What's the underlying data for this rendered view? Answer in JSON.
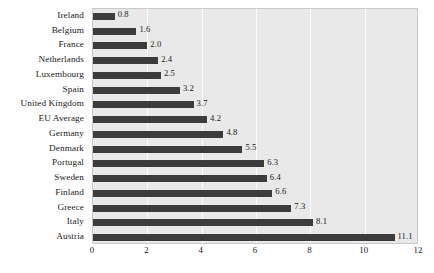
{
  "chart_data": {
    "type": "bar",
    "orientation": "horizontal",
    "title": "",
    "subtitle": "",
    "xlabel": "",
    "ylabel": "",
    "xlim": [
      0,
      12
    ],
    "xticks": [
      "0",
      "2",
      "4",
      "6",
      "8",
      "10",
      "12"
    ],
    "xtick_values": [
      0,
      2,
      4,
      6,
      8,
      10,
      12
    ],
    "grid": "vertical",
    "legend": "none",
    "categories": [
      "Ireland",
      "Belgium",
      "France",
      "Netherlands",
      "Luxembourg",
      "Spain",
      "United Kingdom",
      "EU Average",
      "Germany",
      "Denmark",
      "Portugal",
      "Sweden",
      "Finland",
      "Greece",
      "Italy",
      "Austria"
    ],
    "values": [
      0.8,
      1.6,
      2.0,
      2.4,
      2.5,
      3.2,
      3.7,
      4.2,
      4.8,
      5.5,
      6.3,
      6.4,
      6.6,
      7.3,
      8.1,
      11.1
    ],
    "value_labels": [
      "0.8",
      "1.6",
      "2.0",
      "2.4",
      "2.5",
      "3.2",
      "3.7",
      "4.2",
      "4.8",
      "5.5",
      "6.3",
      "6.4",
      "6.6",
      "7.3",
      "8.1",
      "11.1"
    ],
    "colors": {
      "bar": "#3c3c3c",
      "plot_background": "#e9e9e9",
      "gridline": "#fbfbfb",
      "axis_text": "#1a1a1a",
      "plot_border": "#c9c9c9",
      "page_background": "#ffffff"
    }
  }
}
